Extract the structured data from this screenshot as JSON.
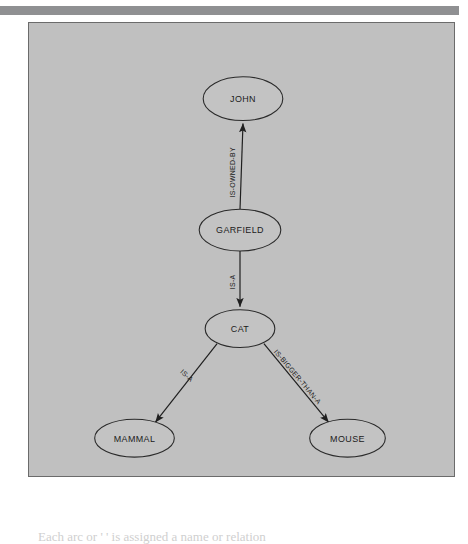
{
  "page": {
    "background_color": "#ffffff",
    "rule_color": "#8f9092"
  },
  "figure": {
    "background_color": "#c0c0c0",
    "border_color": "#6b6b6b",
    "node_fill": "#c3c3c3",
    "node_stroke": "#2a2a2a",
    "edge_color": "#1f1f1f"
  },
  "graph": {
    "title": "Semantic network diagram",
    "nodes": [
      {
        "id": "john",
        "label": "JOHN",
        "cx": 215,
        "cy": 76,
        "rx": 40,
        "ry": 22
      },
      {
        "id": "garfield",
        "label": "GARFIELD",
        "cx": 212,
        "cy": 208,
        "rx": 41,
        "ry": 21
      },
      {
        "id": "cat",
        "label": "CAT",
        "cx": 212,
        "cy": 307,
        "rx": 35,
        "ry": 19
      },
      {
        "id": "mammal",
        "label": "MAMMAL",
        "cx": 106,
        "cy": 417,
        "rx": 40,
        "ry": 19
      },
      {
        "id": "mouse",
        "label": "MOUSE",
        "cx": 320,
        "cy": 417,
        "rx": 38,
        "ry": 19
      }
    ],
    "edges": [
      {
        "id": "garfield-john",
        "label": "IS-OWNED-BY",
        "from": "garfield",
        "to": "john",
        "label_x": 207,
        "label_y": 150,
        "label_rotation": -90
      },
      {
        "id": "garfield-cat",
        "label": "IS-A",
        "from": "garfield",
        "to": "cat",
        "label_x": 207,
        "label_y": 260,
        "label_rotation": -90
      },
      {
        "id": "cat-mammal",
        "label": "IS-A",
        "from": "cat",
        "to": "mammal",
        "label_x": 157,
        "label_y": 356,
        "label_rotation": 42
      },
      {
        "id": "cat-mouse",
        "label": "IS-BIGGER-THAN-A",
        "from": "cat",
        "to": "mouse",
        "label_x": 268,
        "label_y": 357,
        "label_rotation": -46
      }
    ]
  },
  "caption": {
    "text": "Each arc or ' ' is assigned a name or relation"
  }
}
